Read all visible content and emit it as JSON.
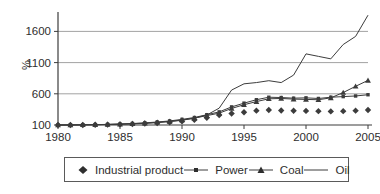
{
  "chart_data": {
    "type": "line",
    "title": "",
    "xlabel": "",
    "ylabel": "%",
    "unit": "%",
    "xlim": [
      1980,
      2005
    ],
    "ylim": [
      100,
      1920
    ],
    "xticks": [
      1980,
      1985,
      1990,
      1995,
      2000,
      2005
    ],
    "yticks": [
      100,
      600,
      1100,
      1600
    ],
    "grid": "horizontal",
    "legend_position": "bottom",
    "x": [
      1980,
      1981,
      1982,
      1983,
      1984,
      1985,
      1986,
      1987,
      1988,
      1989,
      1990,
      1991,
      1992,
      1993,
      1994,
      1995,
      1996,
      1997,
      1998,
      1999,
      2000,
      2001,
      2002,
      2003,
      2004,
      2005
    ],
    "series": [
      {
        "name": "Industrial product",
        "marker": "diamond",
        "line": false,
        "values": [
          100,
          100,
          100,
          103,
          106,
          110,
          116,
          123,
          133,
          145,
          160,
          185,
          215,
          260,
          285,
          305,
          330,
          340,
          332,
          328,
          326,
          322,
          318,
          322,
          330,
          340
        ]
      },
      {
        "name": "Power",
        "marker": "square",
        "line": true,
        "values": [
          100,
          101,
          103,
          106,
          110,
          116,
          124,
          134,
          148,
          165,
          190,
          220,
          265,
          310,
          390,
          450,
          505,
          545,
          540,
          530,
          535,
          525,
          545,
          555,
          565,
          585
        ]
      },
      {
        "name": "Coal",
        "marker": "triangle",
        "line": true,
        "values": [
          100,
          101,
          103,
          105,
          109,
          114,
          121,
          130,
          143,
          158,
          180,
          210,
          250,
          290,
          365,
          425,
          475,
          520,
          525,
          515,
          510,
          505,
          535,
          620,
          720,
          815
        ]
      },
      {
        "name": "Oil",
        "marker": "none",
        "line": true,
        "values": [
          100,
          100,
          102,
          105,
          108,
          112,
          118,
          126,
          138,
          155,
          175,
          210,
          260,
          370,
          660,
          760,
          780,
          810,
          780,
          900,
          1240,
          1200,
          1160,
          1390,
          1520,
          1860
        ]
      }
    ],
    "colors": {
      "line": "#3c3c3c",
      "grid": "#8a8a8a",
      "text": "#2e2e2e",
      "background": "#ffffff"
    }
  },
  "legend": {
    "items": [
      {
        "label": "Industrial product",
        "marker": "diamond"
      },
      {
        "label": "Power",
        "marker": "line-square"
      },
      {
        "label": "Coal",
        "marker": "line-triangle"
      },
      {
        "label": "Oil",
        "marker": "line"
      }
    ]
  }
}
